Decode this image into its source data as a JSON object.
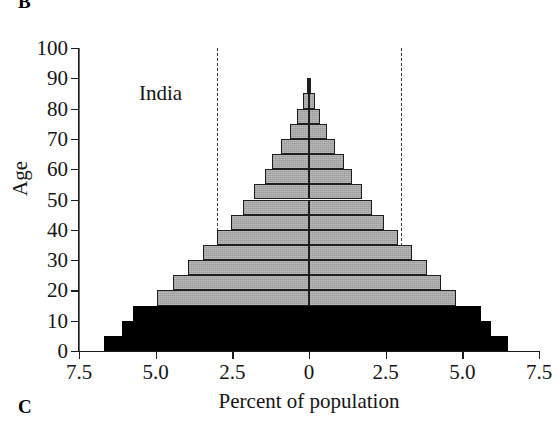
{
  "figure": {
    "panel_label_top": "B",
    "panel_label_bottom": "C"
  },
  "chart_data": {
    "type": "bar",
    "subtype": "population-pyramid",
    "title": "India",
    "xlabel": "Percent of population",
    "ylabel": "Age",
    "xtick_labels": [
      "7.5",
      "5.0",
      "2.5",
      "0",
      "2.5",
      "5.0",
      "7.5"
    ],
    "xtick_values": [
      -7.5,
      -5.0,
      -2.5,
      0,
      2.5,
      5.0,
      7.5
    ],
    "xlim": [
      -7.5,
      7.5
    ],
    "ytick_labels": [
      "0",
      "10",
      "20",
      "30",
      "40",
      "50",
      "60",
      "70",
      "80",
      "90",
      "100"
    ],
    "ytick_values": [
      0,
      10,
      20,
      30,
      40,
      50,
      60,
      70,
      80,
      90,
      100
    ],
    "ylim": [
      0,
      100
    ],
    "grid": false,
    "legend": null,
    "reference_lines": [
      -3.0,
      3.0
    ],
    "reference_line_style": "dashed",
    "center_line": 0,
    "age_groups": [
      "0-4",
      "5-9",
      "10-14",
      "15-19",
      "20-24",
      "25-29",
      "30-34",
      "35-39",
      "40-44",
      "45-49",
      "50-54",
      "55-59",
      "60-64",
      "65-69",
      "70-74",
      "75-79",
      "80-84",
      "85+"
    ],
    "series": [
      {
        "name": "Male",
        "side": "left",
        "values": [
          6.7,
          6.1,
          5.75,
          4.95,
          4.45,
          3.95,
          3.45,
          3.0,
          2.55,
          2.15,
          1.8,
          1.45,
          1.2,
          0.9,
          0.62,
          0.38,
          0.2,
          0.08
        ]
      },
      {
        "name": "Female",
        "side": "right",
        "values": [
          6.5,
          5.95,
          5.6,
          4.8,
          4.3,
          3.85,
          3.35,
          2.9,
          2.45,
          2.05,
          1.72,
          1.4,
          1.15,
          0.86,
          0.58,
          0.36,
          0.19,
          0.08
        ]
      }
    ],
    "bar_colors": {
      "prereproductive_black": "#000000",
      "reproductive_postreproductive_gray": "#a8a8a8",
      "bar_outline": "#1d1d1d"
    },
    "black_age_groups": [
      "0-4",
      "5-9",
      "10-14"
    ]
  }
}
